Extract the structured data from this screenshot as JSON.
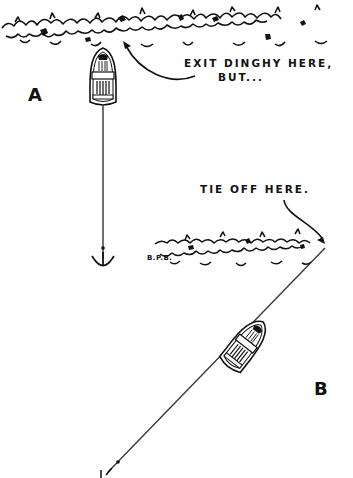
{
  "illustration": {
    "scenario_a": {
      "label": "A",
      "callout": [
        "EXIT DINGHY HERE,",
        "BUT..."
      ],
      "elements": [
        "shoreline-brush",
        "dinghy-bow-to-shore",
        "anchor-line-astern",
        "anchor"
      ]
    },
    "scenario_b": {
      "label": "B",
      "callout": "TIE OFF HERE.",
      "elements": [
        "shoreline-brush",
        "dinghy-diagonal",
        "line-from-shore-to-anchor",
        "anchor"
      ]
    },
    "signature": "B.P.B.",
    "colors": {
      "ink": "#111111",
      "paper": "#ffffff"
    }
  }
}
